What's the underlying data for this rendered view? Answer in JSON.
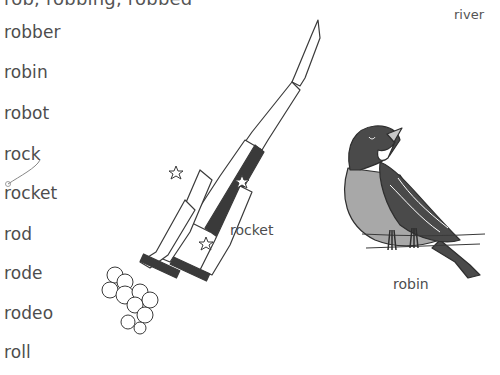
{
  "page": {
    "header_partial": "rob, robbing, robbed",
    "guide_word": "river"
  },
  "word_list": [
    {
      "word": "robber",
      "top": 22
    },
    {
      "word": "robin",
      "top": 62
    },
    {
      "word": "robot",
      "top": 103
    },
    {
      "word": "rock",
      "top": 144
    },
    {
      "word": "rocket",
      "top": 183
    },
    {
      "word": "rod",
      "top": 224
    },
    {
      "word": "rode",
      "top": 263
    },
    {
      "word": "rodeo",
      "top": 303
    },
    {
      "word": "roll",
      "top": 342
    }
  ],
  "illustrations": {
    "rocket": {
      "caption": "rocket"
    },
    "robin": {
      "caption": "robin"
    }
  },
  "colors": {
    "text": "#4d4d4d",
    "ink": "#3a3a3a",
    "robin_head": "#4a4a4a",
    "robin_breast": "#a8a8a8"
  }
}
